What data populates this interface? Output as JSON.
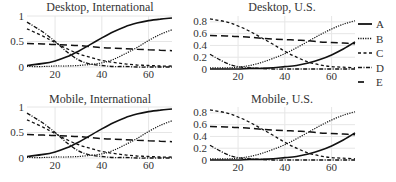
{
  "chart_data": [
    {
      "type": "line",
      "title": "Desktop, International",
      "xlabel": "",
      "ylabel": "",
      "xlim": [
        8,
        70
      ],
      "ylim": [
        0,
        1
      ],
      "xticks": [
        20,
        40,
        60
      ],
      "yticks": [
        0,
        0.5,
        1
      ],
      "ytick_labels": [
        "0",
        "0.5",
        "1"
      ],
      "grid": true,
      "x": [
        8,
        15,
        20,
        25,
        30,
        35,
        40,
        45,
        50,
        55,
        60,
        65,
        70
      ],
      "series": [
        {
          "name": "A",
          "values": [
            0.03,
            0.07,
            0.12,
            0.2,
            0.31,
            0.44,
            0.57,
            0.69,
            0.79,
            0.86,
            0.91,
            0.94,
            0.96
          ]
        },
        {
          "name": "B",
          "values": [
            0.01,
            0.01,
            0.02,
            0.02,
            0.03,
            0.05,
            0.08,
            0.15,
            0.26,
            0.38,
            0.52,
            0.64,
            0.73
          ]
        },
        {
          "name": "C",
          "values": [
            0.75,
            0.6,
            0.48,
            0.36,
            0.26,
            0.19,
            0.13,
            0.09,
            0.06,
            0.04,
            0.03,
            0.02,
            0.02
          ]
        },
        {
          "name": "D",
          "values": [
            0.88,
            0.68,
            0.5,
            0.3,
            0.14,
            0.06,
            0.03,
            0.01,
            0.01,
            0.0,
            0.0,
            0.0,
            0.0
          ]
        },
        {
          "name": "E",
          "values": [
            0.46,
            0.45,
            0.44,
            0.43,
            0.42,
            0.4,
            0.38,
            0.37,
            0.36,
            0.35,
            0.34,
            0.33,
            0.32
          ]
        }
      ]
    },
    {
      "type": "line",
      "title": "Desktop, U.S.",
      "xlabel": "",
      "ylabel": "",
      "xlim": [
        8,
        70
      ],
      "ylim": [
        0,
        0.9
      ],
      "xticks": [
        20,
        40,
        60
      ],
      "yticks": [
        0,
        0.2,
        0.4,
        0.6,
        0.8
      ],
      "ytick_labels": [
        "0",
        "0.2",
        "0.4",
        "0.6",
        "0.8"
      ],
      "grid": true,
      "x": [
        8,
        15,
        20,
        25,
        30,
        35,
        40,
        45,
        50,
        55,
        60,
        65,
        70
      ],
      "series": [
        {
          "name": "A",
          "values": [
            0.0,
            0.0,
            0.0,
            0.01,
            0.01,
            0.02,
            0.04,
            0.06,
            0.1,
            0.16,
            0.24,
            0.34,
            0.46
          ]
        },
        {
          "name": "B",
          "values": [
            0.02,
            0.02,
            0.03,
            0.06,
            0.11,
            0.18,
            0.26,
            0.36,
            0.47,
            0.58,
            0.68,
            0.76,
            0.82
          ]
        },
        {
          "name": "C",
          "values": [
            0.85,
            0.8,
            0.73,
            0.64,
            0.53,
            0.42,
            0.3,
            0.2,
            0.12,
            0.07,
            0.04,
            0.03,
            0.02
          ]
        },
        {
          "name": "D",
          "values": [
            0.25,
            0.1,
            0.04,
            0.02,
            0.01,
            0.0,
            0.0,
            0.0,
            0.0,
            0.0,
            0.0,
            0.0,
            0.0
          ]
        },
        {
          "name": "E",
          "values": [
            0.57,
            0.56,
            0.55,
            0.54,
            0.52,
            0.51,
            0.5,
            0.49,
            0.48,
            0.46,
            0.45,
            0.44,
            0.43
          ]
        }
      ]
    },
    {
      "type": "line",
      "title": "Mobile, International",
      "xlabel": "",
      "ylabel": "",
      "xlim": [
        8,
        70
      ],
      "ylim": [
        0,
        1
      ],
      "xticks": [
        20,
        40,
        60
      ],
      "yticks": [
        0,
        0.5,
        1
      ],
      "ytick_labels": [
        "0",
        "0.5",
        "1"
      ],
      "grid": true,
      "x": [
        8,
        15,
        20,
        25,
        30,
        35,
        40,
        45,
        50,
        55,
        60,
        65,
        70
      ],
      "series": [
        {
          "name": "A",
          "values": [
            0.03,
            0.07,
            0.12,
            0.2,
            0.31,
            0.44,
            0.57,
            0.69,
            0.79,
            0.86,
            0.91,
            0.94,
            0.96
          ]
        },
        {
          "name": "B",
          "values": [
            0.01,
            0.01,
            0.02,
            0.02,
            0.03,
            0.05,
            0.08,
            0.15,
            0.26,
            0.38,
            0.52,
            0.64,
            0.73
          ]
        },
        {
          "name": "C",
          "values": [
            0.75,
            0.6,
            0.48,
            0.36,
            0.26,
            0.19,
            0.13,
            0.09,
            0.06,
            0.04,
            0.03,
            0.02,
            0.02
          ]
        },
        {
          "name": "D",
          "values": [
            0.88,
            0.68,
            0.5,
            0.3,
            0.14,
            0.06,
            0.03,
            0.01,
            0.01,
            0.0,
            0.0,
            0.0,
            0.0
          ]
        },
        {
          "name": "E",
          "values": [
            0.46,
            0.45,
            0.44,
            0.43,
            0.42,
            0.4,
            0.38,
            0.37,
            0.36,
            0.35,
            0.34,
            0.33,
            0.32
          ]
        }
      ]
    },
    {
      "type": "line",
      "title": "Mobile, U.S.",
      "xlabel": "",
      "ylabel": "",
      "xlim": [
        8,
        70
      ],
      "ylim": [
        0,
        0.9
      ],
      "xticks": [
        20,
        40,
        60
      ],
      "yticks": [
        0,
        0.2,
        0.4,
        0.6,
        0.8
      ],
      "ytick_labels": [
        "0",
        "0.2",
        "0.4",
        "0.6",
        "0.8"
      ],
      "grid": true,
      "x": [
        8,
        15,
        20,
        25,
        30,
        35,
        40,
        45,
        50,
        55,
        60,
        65,
        70
      ],
      "series": [
        {
          "name": "A",
          "values": [
            0.0,
            0.0,
            0.0,
            0.01,
            0.01,
            0.02,
            0.04,
            0.06,
            0.1,
            0.16,
            0.24,
            0.34,
            0.46
          ]
        },
        {
          "name": "B",
          "values": [
            0.02,
            0.02,
            0.03,
            0.06,
            0.11,
            0.18,
            0.26,
            0.36,
            0.47,
            0.58,
            0.68,
            0.76,
            0.82
          ]
        },
        {
          "name": "C",
          "values": [
            0.85,
            0.8,
            0.73,
            0.64,
            0.53,
            0.42,
            0.3,
            0.2,
            0.12,
            0.07,
            0.04,
            0.03,
            0.02
          ]
        },
        {
          "name": "D",
          "values": [
            0.25,
            0.1,
            0.04,
            0.02,
            0.01,
            0.0,
            0.0,
            0.0,
            0.0,
            0.0,
            0.0,
            0.0,
            0.0
          ]
        },
        {
          "name": "E",
          "values": [
            0.57,
            0.56,
            0.55,
            0.54,
            0.52,
            0.51,
            0.5,
            0.49,
            0.48,
            0.46,
            0.45,
            0.44,
            0.43
          ]
        }
      ]
    }
  ],
  "legend": {
    "position": "right",
    "entries": [
      {
        "label": "A",
        "style": "solid"
      },
      {
        "label": "B",
        "style": "dotted"
      },
      {
        "label": "C",
        "style": "short-dash"
      },
      {
        "label": "D",
        "style": "dash-dot"
      },
      {
        "label": "E",
        "style": "long-dash"
      }
    ]
  },
  "colors": {
    "line": "#111111",
    "grid": "#e6e6e6",
    "text": "#333333"
  }
}
